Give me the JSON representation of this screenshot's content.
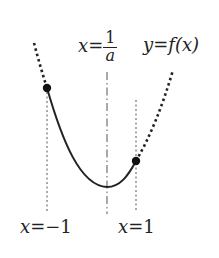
{
  "diagram": {
    "labels": {
      "axis_center": {
        "lhs": "x",
        "eq": "=",
        "num": "1",
        "den": "a"
      },
      "curve": {
        "text_y": "y",
        "eq": "=",
        "text_f": "f",
        "paren": "(x)"
      },
      "left_line": {
        "lhs": "x",
        "eq": "=",
        "rhs": "−1"
      },
      "right_line": {
        "lhs": "x",
        "eq": "=",
        "rhs": "1"
      }
    },
    "elements": {
      "curve_solid": "parabola segment from x=-1 to x=1",
      "curve_dotted_left": "dotted extension beyond x=-1",
      "curve_dotted_right": "dotted extension beyond x=1",
      "axis_of_symmetry": "dash-dot vertical line x=1/a",
      "points": [
        "point at x=-1",
        "point at x=1"
      ]
    },
    "colors": {
      "stroke": "#222222",
      "guide": "#555555",
      "background": "#ffffff"
    }
  }
}
